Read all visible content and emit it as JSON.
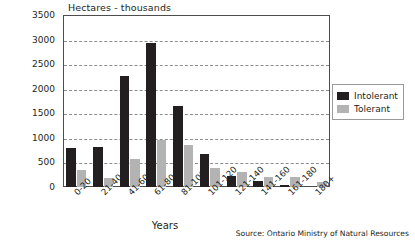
{
  "chart_data": {
    "type": "bar",
    "title": "Hectares - thousands",
    "xlabel": "Years",
    "ylabel": "",
    "ylim": [
      0,
      3500
    ],
    "ytick_step": 500,
    "grid": true,
    "legend_position": "right",
    "source": "Source: Ontario Ministry of Natural Resources",
    "categories": [
      "0-20",
      "21-40",
      "41-60",
      "61-80",
      "81-100",
      "101-120",
      "121-140",
      "141-160",
      "161-180",
      "180+"
    ],
    "ytick_labels": [
      "3500",
      "3000",
      "2500",
      "2000",
      "1500",
      "1000",
      "500",
      "0"
    ],
    "ytick_values": [
      3500,
      3000,
      2500,
      2000,
      1500,
      1000,
      500,
      0
    ],
    "series": [
      {
        "name": "Intolerant",
        "color": "#231f20",
        "values": [
          800,
          810,
          2250,
          2930,
          1650,
          680,
          230,
          130,
          40,
          0
        ]
      },
      {
        "name": "Tolerant",
        "color": "#b3b3b3",
        "values": [
          350,
          180,
          570,
          960,
          860,
          380,
          300,
          210,
          200,
          110
        ]
      }
    ]
  },
  "legend": {
    "items": [
      {
        "label": "Intolerant"
      },
      {
        "label": "Tolerant"
      }
    ]
  }
}
